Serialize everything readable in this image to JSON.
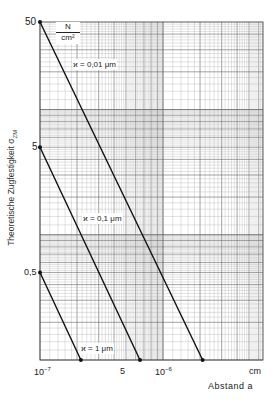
{
  "chart_data": {
    "type": "line",
    "title": "",
    "xlabel": "Abstand a",
    "x_unit": "cm",
    "ylabel": "Theoretische Zugfestigkeit σZM",
    "y_unit": "N/cm²",
    "x_scale": "log",
    "y_scale": "log",
    "xlim": [
      1e-07,
      6.5e-06
    ],
    "ylim": [
      0.1,
      50
    ],
    "grid": true,
    "x_ticks": [
      {
        "value": 1e-07,
        "label": "10⁻⁷"
      },
      {
        "value": 5e-07,
        "label": "5"
      },
      {
        "value": 1e-06,
        "label": "10⁻⁶"
      }
    ],
    "y_ticks": [
      {
        "value": 50,
        "label": "50"
      },
      {
        "value": 5,
        "label": "5"
      },
      {
        "value": 0.5,
        "label": "0,5"
      }
    ],
    "series": [
      {
        "name": "ϰ = 0,01 μm",
        "points": [
          [
            1e-07,
            50
          ],
          [
            2.1e-06,
            0.1
          ]
        ]
      },
      {
        "name": "ϰ = 0,1 μm",
        "points": [
          [
            1e-07,
            5
          ],
          [
            6.5e-07,
            0.1
          ]
        ]
      },
      {
        "name": "ϰ = 1 μm",
        "points": [
          [
            1e-07,
            0.5
          ],
          [
            2.15e-07,
            0.1
          ]
        ]
      }
    ]
  },
  "labels": {
    "y_title": "Theoretische Zugfestigkeit σ",
    "y_title_sub": "ZM",
    "unit_num": "N",
    "unit_den": "cm²",
    "x_unit": "cm",
    "x_title": "Abstand a",
    "xtick_1e7_base": "10",
    "xtick_1e7_exp": "−7",
    "xtick_5": "5",
    "xtick_1e6_base": "10",
    "xtick_1e6_exp": "−6",
    "ytick_50": "50",
    "ytick_5": "5",
    "ytick_05": "0,5",
    "series_0": "ϰ = 0,01 μm",
    "series_1": "ϰ = 0,1 μm",
    "series_2": "ϰ = 1 μm"
  }
}
